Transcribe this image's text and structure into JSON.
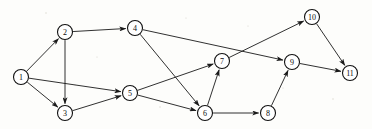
{
  "figure": {
    "background_color": "#fdfdfb",
    "node_fill": "#ffffff",
    "node_stroke": "#111111",
    "edge_color": "#1a1a1a",
    "width": 372,
    "height": 129
  },
  "graph": {
    "type": "directed",
    "node_radius": 7.5,
    "nodes": [
      {
        "id": "1",
        "label": "1",
        "x": 21,
        "y": 77
      },
      {
        "id": "2",
        "label": "2",
        "x": 65,
        "y": 32
      },
      {
        "id": "3",
        "label": "3",
        "x": 65,
        "y": 113
      },
      {
        "id": "4",
        "label": "4",
        "x": 135,
        "y": 28
      },
      {
        "id": "5",
        "label": "5",
        "x": 130,
        "y": 93
      },
      {
        "id": "6",
        "label": "6",
        "x": 205,
        "y": 113
      },
      {
        "id": "7",
        "label": "7",
        "x": 222,
        "y": 61
      },
      {
        "id": "8",
        "label": "8",
        "x": 268,
        "y": 113
      },
      {
        "id": "9",
        "label": "9",
        "x": 292,
        "y": 62
      },
      {
        "id": "10",
        "label": "10",
        "x": 312,
        "y": 17
      },
      {
        "id": "11",
        "label": "11",
        "x": 350,
        "y": 73
      }
    ],
    "edges": [
      {
        "from": "1",
        "to": "2",
        "directed": true
      },
      {
        "from": "1",
        "to": "3",
        "directed": true
      },
      {
        "from": "1",
        "to": "5",
        "directed": true
      },
      {
        "from": "2",
        "to": "3",
        "directed": true
      },
      {
        "from": "2",
        "to": "4",
        "directed": true
      },
      {
        "from": "3",
        "to": "5",
        "directed": true
      },
      {
        "from": "4",
        "to": "6",
        "directed": true
      },
      {
        "from": "4",
        "to": "9",
        "directed": true
      },
      {
        "from": "5",
        "to": "6",
        "directed": true
      },
      {
        "from": "5",
        "to": "7",
        "directed": true
      },
      {
        "from": "6",
        "to": "7",
        "directed": true
      },
      {
        "from": "6",
        "to": "8",
        "directed": true
      },
      {
        "from": "7",
        "to": "10",
        "directed": true
      },
      {
        "from": "8",
        "to": "9",
        "directed": true
      },
      {
        "from": "9",
        "to": "11",
        "directed": true
      },
      {
        "from": "10",
        "to": "11",
        "directed": true
      }
    ]
  }
}
